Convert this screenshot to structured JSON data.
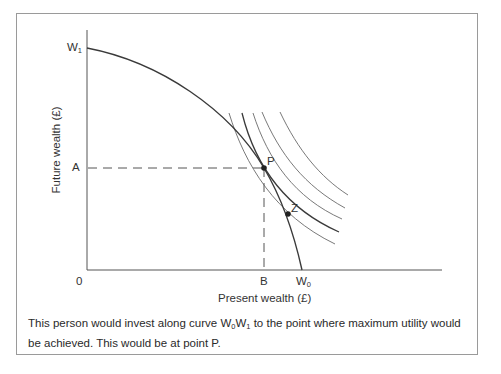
{
  "diagram": {
    "y_axis_label": "Future wealth (£)",
    "x_axis_label": "Present wealth (£)",
    "origin_label": "0",
    "y_ticks": [
      {
        "label": "W",
        "sub": "1",
        "meaning": "max future wealth"
      },
      {
        "label": "A",
        "sub": ""
      }
    ],
    "x_ticks": [
      {
        "label": "B",
        "sub": ""
      },
      {
        "label": "W",
        "sub": "0",
        "meaning": "max present wealth"
      }
    ],
    "points": [
      {
        "label": "P",
        "role": "tangency / optimum"
      },
      {
        "label": "Z",
        "role": "alternative point on curve"
      }
    ],
    "curves": {
      "investment_opportunity_curve": "W0W1",
      "indifference_curve_count": 5
    },
    "colors": {
      "curve": "#3a3a3a",
      "indifference": "#6a6a6a",
      "axis": "#555555",
      "frame": "#9a9a9a"
    }
  },
  "caption": {
    "part1": "This person would invest along curve W",
    "sub1": "0",
    "part2": "W",
    "sub2": "1",
    "part3": " to the point where maximum utility would be achieved. This would be at point P."
  }
}
